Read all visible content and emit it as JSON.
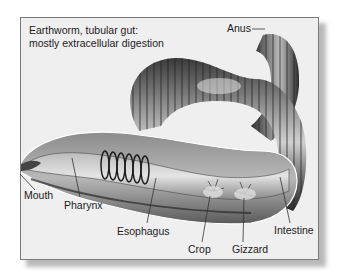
{
  "figure": {
    "title_line1": "Earthworm, tubular gut:",
    "title_line2": "mostly extracellular digestion",
    "colors": {
      "frame_bg": "#efefef",
      "frame_border": "#7a7a7a",
      "label_text": "#222222",
      "body_dark": "#2a2a2a",
      "body_mid": "#6a6a6a",
      "body_light": "#c8c8c8"
    },
    "labels": [
      {
        "id": "anus",
        "text": "Anus",
        "x": 227,
        "y": 22
      },
      {
        "id": "mouth",
        "text": "Mouth",
        "x": 24,
        "y": 189
      },
      {
        "id": "pharynx",
        "text": "Pharynx",
        "x": 64,
        "y": 199
      },
      {
        "id": "esophagus",
        "text": "Esophagus",
        "x": 117,
        "y": 225
      },
      {
        "id": "crop",
        "text": "Crop",
        "x": 188,
        "y": 243
      },
      {
        "id": "gizzard",
        "text": "Gizzard",
        "x": 232,
        "y": 243
      },
      {
        "id": "intestine",
        "text": "Intestine",
        "x": 274,
        "y": 224
      }
    ]
  }
}
